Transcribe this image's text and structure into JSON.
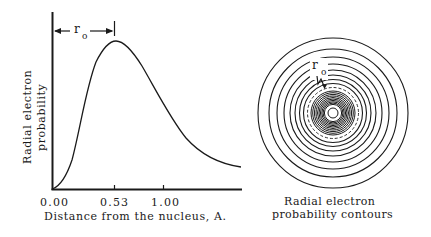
{
  "left_panel": {
    "y_axis_label_line1": "Radial electron",
    "y_axis_label_line2": "probability",
    "x_axis_label": "Distance from the nucleus, A.",
    "x_ticks": [
      "0.00",
      "0.53",
      "1.00"
    ],
    "peak_annotation": {
      "symbol": "r",
      "subscript": "o"
    }
  },
  "right_panel": {
    "caption_line1": "Radial electron",
    "caption_line2": "probability contours",
    "annotation": {
      "symbol": "r",
      "subscript": "o"
    },
    "outer_ring_radii": [
      75,
      64,
      56,
      49,
      43,
      38,
      33.5,
      29.5
    ],
    "dashed_ring_radius": 25.5,
    "dense_ring_radii": [
      22,
      20.3,
      18.6,
      17,
      15.5,
      14,
      12.6,
      11.2,
      9.9,
      8.6
    ],
    "core_radius": 5
  },
  "chart_data": {
    "type": "line",
    "title": "",
    "xlabel": "Distance from the nucleus, A.",
    "ylabel": "Radial electron probability",
    "x_ticks": [
      0.0,
      0.53,
      1.0
    ],
    "xlim": [
      0.0,
      1.6
    ],
    "grid": false,
    "legend": null,
    "annotations": [
      {
        "text": "r_o",
        "x_from": 0.0,
        "x_to": 0.53,
        "meaning": "distance to probability maximum"
      }
    ],
    "series": [
      {
        "name": "Radial electron probability (hydrogen 1s)",
        "x": [
          0.0,
          0.1,
          0.2,
          0.3,
          0.4,
          0.53,
          0.7,
          0.9,
          1.1,
          1.3,
          1.6
        ],
        "y": [
          0.0,
          0.12,
          0.38,
          0.68,
          0.9,
          1.0,
          0.93,
          0.74,
          0.52,
          0.34,
          0.16
        ]
      }
    ]
  }
}
